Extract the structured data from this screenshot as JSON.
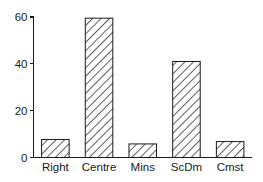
{
  "chart_data": {
    "type": "bar",
    "title": "",
    "subtitle": "",
    "xlabel": "",
    "ylabel": "",
    "categories": [
      "Right",
      "Centre",
      "Mins",
      "ScDm",
      "Cmst"
    ],
    "values": [
      7.7,
      59.5,
      5.8,
      41,
      6.8
    ],
    "ylim": [
      0,
      60
    ],
    "yticks": [
      0,
      20,
      40,
      60
    ],
    "ytick_labels": [
      "0",
      "20",
      "40",
      "60"
    ],
    "grid": false,
    "legend": null,
    "bar_fill": "#ffffff",
    "bar_edge": "#1a1a1a",
    "bar_hatch": "diagonal-45",
    "axis_color": "#1a1a1a",
    "background": "#ffffff"
  },
  "axes": {
    "y_axis_name": "y-axis",
    "x_axis_name": "x-axis"
  }
}
